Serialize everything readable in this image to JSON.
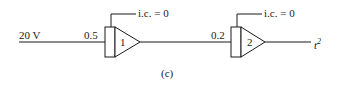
{
  "diagram": {
    "input_label": "20 V",
    "caption": "(c)",
    "integrators": [
      {
        "id": "1",
        "gain": "0.5",
        "ic": "i.c. = 0"
      },
      {
        "id": "2",
        "gain": "0.2",
        "ic": "i.c. = 0"
      }
    ],
    "output_label": "t",
    "output_exponent": "2"
  }
}
